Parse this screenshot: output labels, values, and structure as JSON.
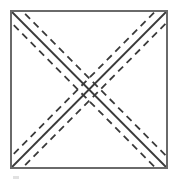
{
  "figure": {
    "type": "line-diagram",
    "canvas": {
      "width": 177,
      "height": 182,
      "background": "#ffffff"
    },
    "colors": {
      "square_stroke": "#6a6a6a",
      "diagonal_solid_stroke": "#3a3a3a",
      "diagonal_dashed_stroke": "#3a3a3a",
      "artifact": "#c9c9c9",
      "background": "#ffffff"
    },
    "square": {
      "label": "outer square outline",
      "x": 11,
      "y": 11,
      "width": 156,
      "height": 157,
      "stroke_width": 2
    },
    "diagonals": [
      {
        "label": "diagonal top-left to bottom-right",
        "x1": 11,
        "y1": 11,
        "x2": 167,
        "y2": 168,
        "style": "solid",
        "stroke_width": 1.8
      },
      {
        "label": "diagonal bottom-left to top-right",
        "x1": 11,
        "y1": 168,
        "x2": 167,
        "y2": 11,
        "style": "solid",
        "stroke_width": 1.8
      }
    ],
    "dashed_offsets": [
      -8,
      8
    ],
    "dash_pattern": "7 5",
    "dashed_stroke_width": 1.8,
    "intersection": {
      "label": "center crossing point",
      "x": 89,
      "y": 89.5
    },
    "artifact_mark": {
      "label": "faint scan artifact below square",
      "x": 13,
      "y": 176,
      "width": 6,
      "height": 3
    }
  },
  "chart_data": {
    "type": "line",
    "xlabel": "",
    "ylabel": "",
    "xlim": [
      0,
      177
    ],
    "ylim": [
      0,
      182
    ],
    "grid": false,
    "legend": "none",
    "series": [
      {
        "name": "square-outline",
        "style": "solid",
        "x": [
          11,
          167,
          167,
          11,
          11
        ],
        "y": [
          11,
          11,
          168,
          168,
          11
        ]
      },
      {
        "name": "diagonal-tl-br-solid",
        "style": "solid",
        "x": [
          11,
          167
        ],
        "y": [
          11,
          168
        ]
      },
      {
        "name": "diagonal-bl-tr-solid",
        "style": "solid",
        "x": [
          11,
          167
        ],
        "y": [
          168,
          11
        ]
      },
      {
        "name": "diagonal-tl-br-dash-upper",
        "style": "dashed",
        "x": [
          11,
          167
        ],
        "y": [
          11,
          168
        ],
        "offset": -8
      },
      {
        "name": "diagonal-tl-br-dash-lower",
        "style": "dashed",
        "x": [
          11,
          167
        ],
        "y": [
          11,
          168
        ],
        "offset": 8
      },
      {
        "name": "diagonal-bl-tr-dash-upper",
        "style": "dashed",
        "x": [
          11,
          167
        ],
        "y": [
          168,
          11
        ],
        "offset": -8
      },
      {
        "name": "diagonal-bl-tr-dash-lower",
        "style": "dashed",
        "x": [
          11,
          167
        ],
        "y": [
          168,
          11
        ],
        "offset": 8
      }
    ]
  }
}
